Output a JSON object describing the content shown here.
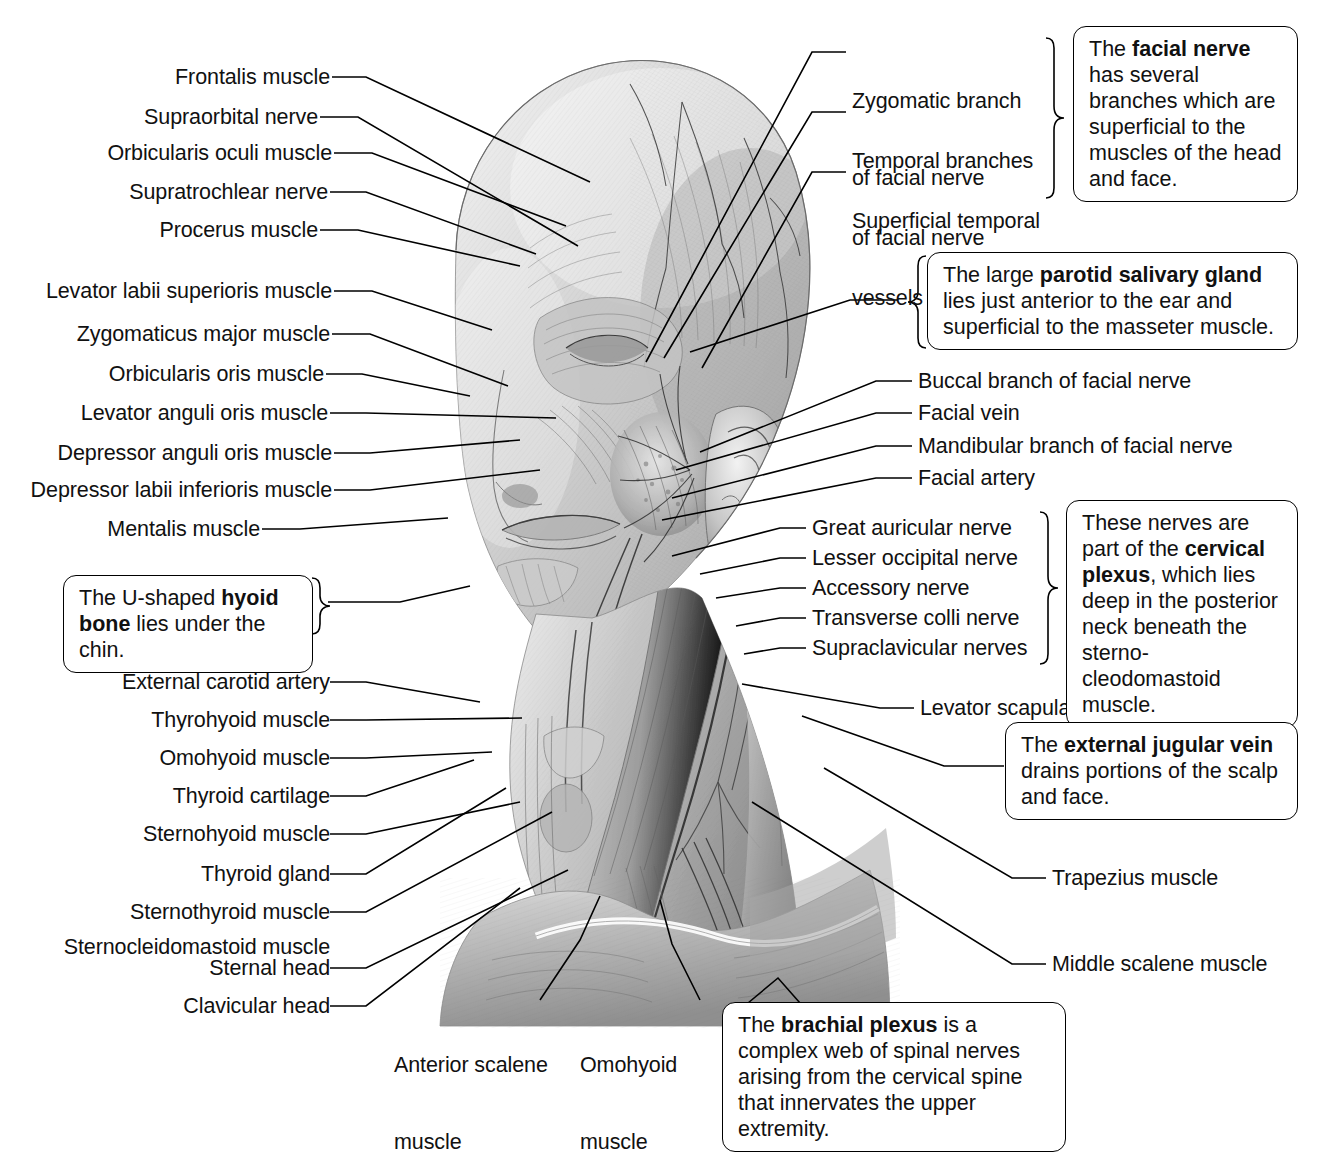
{
  "figure": {
    "illustration_name": "head-and-neck-lateral-dissection"
  },
  "labels_left": [
    {
      "id": "frontalis-muscle",
      "text": "Frontalis muscle"
    },
    {
      "id": "supraorbital-nerve",
      "text": "Supraorbital nerve"
    },
    {
      "id": "orbicularis-oculi-muscle",
      "text": "Orbicularis oculi muscle"
    },
    {
      "id": "supratrochlear-nerve",
      "text": "Supratrochlear nerve"
    },
    {
      "id": "procerus-muscle",
      "text": "Procerus muscle"
    },
    {
      "id": "levator-labii-superioris-muscle",
      "text": "Levator labii superioris muscle"
    },
    {
      "id": "zygomaticus-major-muscle",
      "text": "Zygomaticus major muscle"
    },
    {
      "id": "orbicularis-oris-muscle",
      "text": "Orbicularis oris muscle"
    },
    {
      "id": "levator-anguli-oris-muscle",
      "text": "Levator anguli oris muscle"
    },
    {
      "id": "depressor-anguli-oris-muscle",
      "text": "Depressor anguli oris muscle"
    },
    {
      "id": "depressor-labii-inferioris-muscle",
      "text": "Depressor labii inferioris muscle"
    },
    {
      "id": "mentalis-muscle",
      "text": "Mentalis muscle"
    },
    {
      "id": "external-carotid-artery",
      "text": "External carotid artery"
    },
    {
      "id": "thyrohyoid-muscle",
      "text": "Thyrohyoid muscle"
    },
    {
      "id": "omohyoid-muscle-left",
      "text": "Omohyoid muscle"
    },
    {
      "id": "thyroid-cartilage",
      "text": "Thyroid cartilage"
    },
    {
      "id": "sternohyoid-muscle",
      "text": "Sternohyoid muscle"
    },
    {
      "id": "thyroid-gland",
      "text": "Thyroid gland"
    },
    {
      "id": "sternothyroid-muscle",
      "text": "Sternothyroid muscle"
    },
    {
      "id": "sternocleidomastoid-muscle",
      "text": "Sternocleidomastoid muscle"
    },
    {
      "id": "sternal-head",
      "text": "Sternal head"
    },
    {
      "id": "clavicular-head",
      "text": "Clavicular head"
    }
  ],
  "labels_right_top": [
    {
      "id": "zygomatic-branch-of-facial-nerve",
      "line1": "Zygomatic branch",
      "line2": "of facial nerve"
    },
    {
      "id": "temporal-branches-of-facial-nerve",
      "line1": "Temporal branches",
      "line2": "of facial nerve"
    },
    {
      "id": "superficial-temporal-vessels-and-nerve",
      "line1": "Superficial temporal",
      "line2": "vessels and nerve"
    }
  ],
  "labels_right_mid": [
    {
      "id": "buccal-branch-of-facial-nerve",
      "text": "Buccal branch of facial nerve"
    },
    {
      "id": "facial-vein",
      "text": "Facial vein"
    },
    {
      "id": "mandibular-branch-of-facial-nerve",
      "text": "Mandibular branch of facial nerve"
    },
    {
      "id": "facial-artery",
      "text": "Facial artery"
    }
  ],
  "labels_cervical_plexus": [
    {
      "id": "great-auricular-nerve",
      "text": "Great auricular nerve"
    },
    {
      "id": "lesser-occipital-nerve",
      "text": "Lesser occipital nerve"
    },
    {
      "id": "accessory-nerve",
      "text": "Accessory nerve"
    },
    {
      "id": "transverse-colli-nerve",
      "text": "Transverse colli nerve"
    },
    {
      "id": "supraclavicular-nerves",
      "text": "Supraclavicular nerves"
    }
  ],
  "labels_right_lower": [
    {
      "id": "levator-scapulae-muscle",
      "text": "Levator scapulae muscle"
    },
    {
      "id": "trapezius-muscle",
      "text": "Trapezius muscle"
    },
    {
      "id": "middle-scalene-muscle",
      "text": "Middle scalene muscle"
    }
  ],
  "labels_bottom": [
    {
      "id": "anterior-scalene-muscle",
      "line1": "Anterior scalene",
      "line2": "muscle"
    },
    {
      "id": "omohyoid-muscle-bottom",
      "line1": "Omohyoid",
      "line2": "muscle"
    }
  ],
  "callouts": {
    "facial_nerve": {
      "id": "facial-nerve-callout",
      "pre": "The ",
      "bold": "facial nerve",
      "post": " has several branches which are superficial to the muscles of the head and face."
    },
    "parotid_gland": {
      "id": "parotid-salivary-gland-callout",
      "pre": "The large ",
      "bold": "parotid salivary gland",
      "post": " lies just anterior to the ear and superficial to the masseter muscle."
    },
    "hyoid_bone": {
      "id": "hyoid-bone-callout",
      "pre": "The U-shaped ",
      "bold": "hyoid bone",
      "post": " lies under the chin."
    },
    "cervical_plexus": {
      "id": "cervical-plexus-callout",
      "pre": "These nerves are part of the ",
      "bold": "cervical plexus",
      "post": ", which lies deep in the posterior neck beneath the sterno-cleodomastoid muscle."
    },
    "external_jugular_vein": {
      "id": "external-jugular-vein-callout",
      "pre": "The ",
      "bold": "external jugular vein",
      "post": " drains portions of the scalp and face."
    },
    "brachial_plexus": {
      "id": "brachial-plexus-callout",
      "pre": "The ",
      "bold": "brachial plexus",
      "post": " is a complex web of spinal nerves arising from the cervical spine that innervates the upper extremity."
    }
  },
  "colors": {
    "ink": "#000000",
    "text": "#111111",
    "background": "#ffffff"
  }
}
